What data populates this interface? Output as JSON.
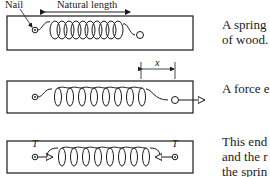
{
  "panels": [
    {
      "labels": {
        "nail": "Nail",
        "natural_length": "Natural length"
      },
      "caption": [
        "A spring",
        "of wood."
      ]
    },
    {
      "labels": {
        "extension": "x"
      },
      "caption": [
        "A force e"
      ]
    },
    {
      "labels": {
        "tension_left": "T",
        "tension_right": "T"
      },
      "caption": [
        "This end",
        "and the r",
        "the sprin"
      ]
    }
  ]
}
